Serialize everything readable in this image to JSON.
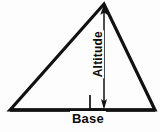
{
  "figure": {
    "background_color": "#fdfdfd",
    "stroke_color": "#111111",
    "labels": {
      "altitude": "Altitude",
      "base": "Base"
    }
  },
  "diagram_data": {
    "type": "geometry-diagram",
    "shape": "triangle",
    "vertices": {
      "apex": [
        104,
        4
      ],
      "bottom_left": [
        10,
        110
      ],
      "bottom_right": [
        155,
        110
      ]
    },
    "segments": [
      {
        "name": "left-side",
        "from": [
          10,
          110
        ],
        "to": [
          104,
          4
        ],
        "stroke_width": 3
      },
      {
        "name": "right-side",
        "from": [
          104,
          4
        ],
        "to": [
          155,
          110
        ],
        "stroke_width": 3
      },
      {
        "name": "base-side",
        "from": [
          10,
          110
        ],
        "to": [
          155,
          110
        ],
        "stroke_width": 3
      },
      {
        "name": "altitude-line",
        "from": [
          104,
          6
        ],
        "to": [
          104,
          109
        ],
        "stroke_width": 1.4
      }
    ],
    "arrowheads": [
      {
        "name": "altitude-arrow-top",
        "at": [
          104,
          6
        ],
        "direction": "up"
      },
      {
        "name": "altitude-arrow-bottom",
        "at": [
          104,
          109
        ],
        "direction": "down"
      }
    ],
    "right_angle_marker": {
      "x": 90,
      "y": 95,
      "size": 14,
      "stroke_width": 1.6
    },
    "annotations": [
      {
        "name": "altitude-label",
        "text": "Altitude",
        "orientation": "vertical-bottom-to-top",
        "x": 97,
        "y": 56
      },
      {
        "name": "base-label",
        "text": "Base",
        "orientation": "horizontal",
        "x": 86,
        "y": 118
      }
    ]
  }
}
